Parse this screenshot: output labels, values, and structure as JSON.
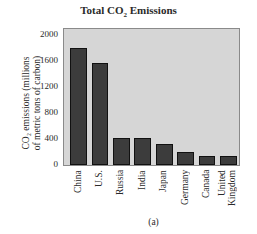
{
  "chart_data": {
    "type": "bar",
    "title": "Total CO2 Emissions",
    "title_main": "Total CO",
    "title_sub": "2",
    "title_rest": " Emissions",
    "xlabel": "",
    "ylabel": "CO2 emissions (millions of metric tons of carbon)",
    "ylabel_line1": "CO₂ emissions (millions",
    "ylabel_line2": "of metric tons of carbon)",
    "categories": [
      "China",
      "U.S.",
      "Russia",
      "India",
      "Japan",
      "Germany",
      "Canada",
      "United Kingdom"
    ],
    "category_lines": [
      [
        "China"
      ],
      [
        "U.S."
      ],
      [
        "Russia"
      ],
      [
        "India"
      ],
      [
        "Japan"
      ],
      [
        "Germany"
      ],
      [
        "Canada"
      ],
      [
        "United",
        "Kingdom"
      ]
    ],
    "values": [
      1800,
      1580,
      420,
      420,
      330,
      200,
      140,
      140
    ],
    "ylim": [
      0,
      2100
    ],
    "yticks": [
      0,
      400,
      800,
      1200,
      1600,
      2000
    ],
    "grid": false,
    "legend": null,
    "caption": "(a)",
    "colors": {
      "bar": "#3c3c3c",
      "plot_bg": "#d6d6d6"
    }
  }
}
